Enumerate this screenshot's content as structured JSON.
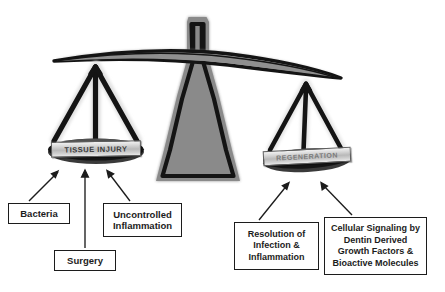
{
  "diagram": {
    "fulcrum_color": "#8a8a8a",
    "outline_color": "#141414",
    "background": "#ffffff"
  },
  "pans": {
    "left": {
      "label": "TISSUE INJURY",
      "state": "down"
    },
    "right": {
      "label": "REGENERATION",
      "state": "up"
    }
  },
  "factors": {
    "injury": [
      {
        "id": "bacteria",
        "lines": [
          "Bacteria"
        ]
      },
      {
        "id": "surgery",
        "lines": [
          "Surgery"
        ]
      },
      {
        "id": "uncontrolled-inflammation",
        "lines": [
          "Uncontrolled",
          "Inflammation"
        ]
      }
    ],
    "regeneration": [
      {
        "id": "resolution",
        "lines": [
          "Resolution of",
          "Infection &",
          "Inflammation"
        ]
      },
      {
        "id": "cellular-signaling",
        "lines": [
          "Cellular Signaling by",
          "Dentin Derived",
          "Growth Factors &",
          "Bioactive Molecules"
        ]
      }
    ]
  },
  "caption": {
    "text": ""
  }
}
